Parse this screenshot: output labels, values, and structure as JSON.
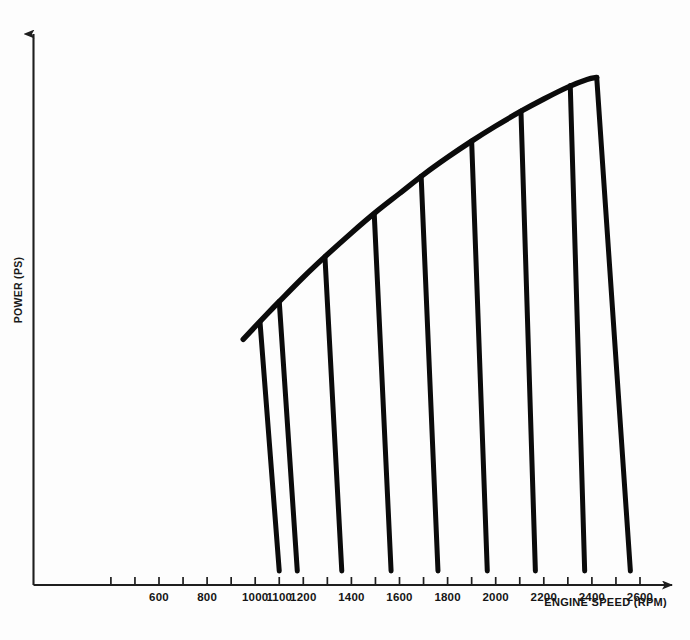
{
  "figure": {
    "background_color": "#fdfdfd",
    "ink_color": "#0b0b0b",
    "axis_color": "#1e1e1e"
  },
  "axes": {
    "x_title": "ENGINE SPEED (RPM)",
    "y_title": "POWER (PS)",
    "x_arrow": true,
    "y_arrow": true
  },
  "chart_data": {
    "type": "line",
    "title": "",
    "subtitle": "",
    "xlabel": "ENGINE SPEED (RPM)",
    "ylabel": "POWER (PS)",
    "grid": false,
    "legend": "none",
    "xlim": [
      400,
      2700
    ],
    "ylim": [
      0,
      100
    ],
    "x_ticks": [
      400,
      500,
      600,
      700,
      800,
      900,
      1000,
      1100,
      1200,
      1300,
      1400,
      1500,
      1600,
      1700,
      1800,
      1900,
      2000,
      2100,
      2200,
      2300,
      2400,
      2500,
      2600
    ],
    "x_tick_labels": [
      {
        "value": 600,
        "label": "600"
      },
      {
        "value": 800,
        "label": "800"
      },
      {
        "value": 1000,
        "label": "1000"
      },
      {
        "value": 1100,
        "label": "1100"
      },
      {
        "value": 1200,
        "label": "1200"
      },
      {
        "value": 1400,
        "label": "1400"
      },
      {
        "value": 1600,
        "label": "1600"
      },
      {
        "value": 1800,
        "label": "1800"
      },
      {
        "value": 2000,
        "label": "2000"
      },
      {
        "value": 2200,
        "label": "2200"
      },
      {
        "value": 2400,
        "label": "2400"
      },
      {
        "value": 2600,
        "label": "2600"
      }
    ],
    "y_ticks": [],
    "y_tick_labels": [],
    "series": [
      {
        "name": "Full-load power envelope",
        "type": "line",
        "x": [
          950,
          1050,
          1100,
          1200,
          1300,
          1400,
          1500,
          1600,
          1700,
          1800,
          1900,
          2000,
          2100,
          2200,
          2300,
          2380,
          2420
        ],
        "y": [
          45.5,
          50.2,
          52.5,
          57.0,
          61.2,
          65.2,
          69.0,
          72.5,
          76.0,
          79.2,
          82.2,
          85.0,
          87.6,
          90.0,
          92.2,
          93.6,
          94.0
        ]
      },
      {
        "name": "Governor droop lines",
        "type": "droop",
        "lines": [
          {
            "rated_speed": 1100,
            "top_x": 1020,
            "top_y": 48.7,
            "bottom_x": 1100,
            "bottom_y": 2.6
          },
          {
            "rated_speed": 1200,
            "top_x": 1100,
            "top_y": 52.5,
            "bottom_x": 1175,
            "bottom_y": 2.6
          },
          {
            "rated_speed": 1400,
            "top_x": 1290,
            "top_y": 60.8,
            "bottom_x": 1360,
            "bottom_y": 2.6
          },
          {
            "rated_speed": 1600,
            "top_x": 1495,
            "top_y": 68.7,
            "bottom_x": 1565,
            "bottom_y": 2.6
          },
          {
            "rated_speed": 1800,
            "top_x": 1690,
            "top_y": 75.7,
            "bottom_x": 1760,
            "bottom_y": 2.6
          },
          {
            "rated_speed": 2000,
            "top_x": 1900,
            "top_y": 82.2,
            "bottom_x": 1965,
            "bottom_y": 2.6
          },
          {
            "rated_speed": 2200,
            "top_x": 2105,
            "top_y": 87.8,
            "bottom_x": 2165,
            "bottom_y": 2.6
          },
          {
            "rated_speed": 2400,
            "top_x": 2310,
            "top_y": 92.5,
            "bottom_x": 2370,
            "bottom_y": 2.6
          },
          {
            "rated_speed": 2600,
            "top_x": 2420,
            "top_y": 94.0,
            "bottom_x": 2560,
            "bottom_y": 2.6
          }
        ]
      }
    ],
    "annotations": []
  }
}
